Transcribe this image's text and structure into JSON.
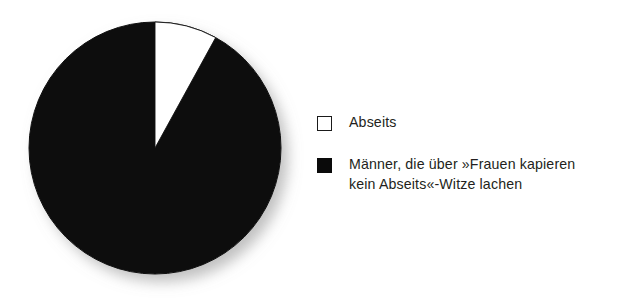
{
  "background_color": "#ffffff",
  "chart_data": {
    "type": "pie",
    "title": "",
    "subtitle": "",
    "xlabel": "",
    "ylabel": "",
    "legend_position": "right",
    "grid": false,
    "start_angle_deg": 0,
    "direction": "clockwise",
    "categories": [
      "Abseits",
      "Männer, die über »Frauen kapieren kein Abseits«-Witze lachen"
    ],
    "values": [
      8,
      92
    ],
    "unit": "percent",
    "colors": [
      "#ffffff",
      "#0a0a0a"
    ],
    "slices": [
      {
        "label": "Abseits",
        "value": 8,
        "color": "#ffffff",
        "stroke": "#1a1a1a",
        "start_angle_deg": 0,
        "end_angle_deg": 30
      },
      {
        "label": "Männer, die über »Frauen kapieren kein Abseits«-Witze lachen",
        "value": 92,
        "color": "#0a0a0a",
        "stroke": "#0a0a0a",
        "start_angle_deg": 30,
        "end_angle_deg": 360
      }
    ]
  },
  "pie": {
    "center_x": 155,
    "center_y": 148,
    "radius": 126,
    "shadow_color": "#b4b4b4"
  },
  "legend": {
    "items": [
      {
        "swatch": "white-square-swatch",
        "color": "#ffffff",
        "label": "Abseits"
      },
      {
        "swatch": "black-square-swatch",
        "color": "#0a0a0a",
        "label": "Männer, die über »Frauen kapieren\nkein Abseits«-Witze lachen"
      }
    ]
  }
}
